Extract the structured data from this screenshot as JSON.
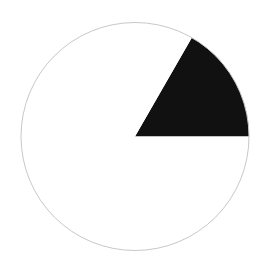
{
  "chart_data": {
    "type": "pie",
    "title": "",
    "categories": [
      "Black sector",
      "White remainder"
    ],
    "values": [
      16.7,
      83.3
    ],
    "colors": [
      "#111111",
      "#ffffff"
    ],
    "start_angle_deg": 0,
    "direction": "counterclockwise",
    "outline_color": "#c8c8c8",
    "legend": null,
    "labels_shown": false
  }
}
